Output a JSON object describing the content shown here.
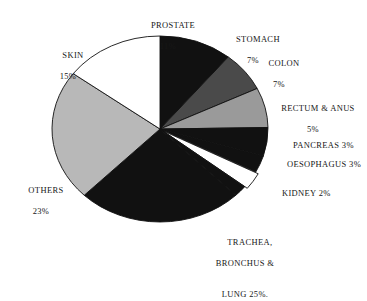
{
  "figure": {
    "background_color": "#ffffff",
    "outline_color": "#111111"
  },
  "chart_data": {
    "type": "pie",
    "title": "",
    "subtitle": "",
    "xlabel": "",
    "ylabel": "",
    "legend_position": "none",
    "grid": false,
    "units": "percent",
    "start_angle_deg": 0,
    "direction": "clockwise",
    "categories": [
      "PROSTATE",
      "STOMACH",
      "COLON",
      "RECTUM & ANUS",
      "PANCREAS",
      "OESOPHAGUS",
      "KIDNEY",
      "TRACHEA, BRONCHUS & LUNG",
      "OTHERS",
      "SKIN"
    ],
    "values": [
      11,
      7,
      7,
      5,
      3,
      3,
      2,
      25,
      23,
      15
    ],
    "slice_colors": [
      "#111111",
      "#4a4a4a",
      "#9a9a9a",
      "#111111",
      "#111111",
      "#ffffff",
      "#111111",
      "#111111",
      "#b8b8b8",
      "#ffffff"
    ],
    "exploded": [
      false,
      false,
      false,
      false,
      false,
      true,
      false,
      false,
      false,
      false
    ],
    "slices": [
      {
        "label": "PROSTATE",
        "value": 11,
        "color": "#111111"
      },
      {
        "label": "STOMACH",
        "value": 7,
        "color": "#4a4a4a"
      },
      {
        "label": "COLON",
        "value": 7,
        "color": "#9a9a9a"
      },
      {
        "label": "RECTUM & ANUS",
        "value": 5,
        "color": "#111111"
      },
      {
        "label": "PANCREAS",
        "value": 3,
        "color": "#111111"
      },
      {
        "label": "OESOPHAGUS",
        "value": 3,
        "color": "#ffffff"
      },
      {
        "label": "KIDNEY",
        "value": 2,
        "color": "#111111"
      },
      {
        "label": "TRACHEA, BRONCHUS & LUNG",
        "value": 25,
        "color": "#111111"
      },
      {
        "label": "OTHERS",
        "value": 23,
        "color": "#b8b8b8"
      },
      {
        "label": "SKIN",
        "value": 15,
        "color": "#ffffff"
      }
    ]
  },
  "labels": {
    "prostate": {
      "name": "PROSTATE",
      "pct": "11%"
    },
    "stomach": {
      "name": "STOMACH",
      "pct": "7%"
    },
    "colon": {
      "name": "COLON",
      "pct": "7%"
    },
    "rectum_anus": {
      "name": "RECTUM & ANUS",
      "pct": "5%"
    },
    "pancreas": {
      "text": "PANCREAS 3%"
    },
    "oesophagus": {
      "text": "OESOPHAGUS 3%"
    },
    "kidney": {
      "text": "KIDNEY 2%"
    },
    "lung": {
      "line1": "TRACHEA,",
      "line2": "BRONCHUS &",
      "line3": "LUNG 25%."
    },
    "others": {
      "name": "OTHERS",
      "pct": "23%"
    },
    "skin": {
      "name": "SKIN",
      "pct": "15%"
    }
  }
}
